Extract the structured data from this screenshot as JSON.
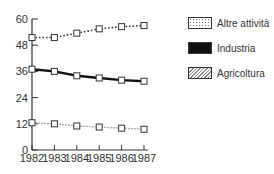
{
  "chart_data": {
    "type": "line",
    "title": "",
    "xlabel": "",
    "ylabel": "",
    "x": [
      "1982",
      "1983",
      "1984",
      "1985",
      "1986",
      "1987"
    ],
    "yticks": [
      0,
      12,
      24,
      36,
      48,
      60
    ],
    "ylim": [
      0,
      60
    ],
    "grid": false,
    "legend_position": "right",
    "series": [
      {
        "name": "Altre attività",
        "style": "dotted",
        "values": [
          51.5,
          51.5,
          53.5,
          55.5,
          56.5,
          57
        ]
      },
      {
        "name": "Industria",
        "style": "solid-thick",
        "values": [
          37,
          36,
          34,
          33,
          32,
          31.5
        ]
      },
      {
        "name": "Agricoltura",
        "style": "hatched-light",
        "values": [
          12.5,
          12,
          11,
          10.5,
          10,
          9.5
        ]
      }
    ]
  },
  "legend": {
    "items": [
      {
        "label": "Altre attività"
      },
      {
        "label": "Industria"
      },
      {
        "label": "Agricoltura"
      }
    ]
  }
}
